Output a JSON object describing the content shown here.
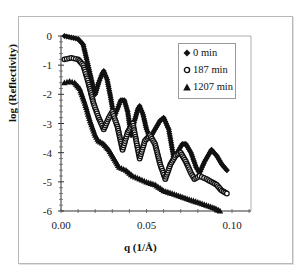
{
  "chart_data": {
    "type": "scatter",
    "title": "",
    "xlabel": "q (1/Å)",
    "ylabel": "log (Reflectivity)",
    "xlim": [
      0.0,
      0.12
    ],
    "ylim": [
      -6,
      0
    ],
    "x_ticks": [
      "0.00",
      "0.05",
      "0.10"
    ],
    "y_ticks": [
      "0",
      "-1",
      "-2",
      "-3",
      "-4",
      "-5",
      "-6"
    ],
    "grid": false,
    "legend_position": "upper right (inside)",
    "series": [
      {
        "name": "0 min",
        "marker": "diamond",
        "x": [
          0.002,
          0.006,
          0.01,
          0.013,
          0.015,
          0.017,
          0.019,
          0.02,
          0.022,
          0.024,
          0.025,
          0.027,
          0.029,
          0.031,
          0.033,
          0.035,
          0.037,
          0.039,
          0.041,
          0.043,
          0.045,
          0.046,
          0.048,
          0.05,
          0.052,
          0.055,
          0.058,
          0.06,
          0.063,
          0.066,
          0.069,
          0.071,
          0.073,
          0.076,
          0.079,
          0.081,
          0.084,
          0.087,
          0.088,
          0.091,
          0.094,
          0.097
        ],
        "y": [
          0.0,
          -0.05,
          -0.1,
          -0.3,
          -0.8,
          -1.3,
          -1.8,
          -2.0,
          -1.6,
          -1.3,
          -1.2,
          -1.5,
          -2.1,
          -2.8,
          -2.5,
          -2.2,
          -2.2,
          -2.6,
          -3.4,
          -2.9,
          -2.5,
          -2.4,
          -2.7,
          -3.2,
          -3.5,
          -3.2,
          -2.9,
          -2.8,
          -3.2,
          -4.2,
          -3.9,
          -3.7,
          -3.7,
          -4.0,
          -4.5,
          -4.7,
          -4.3,
          -4.0,
          -3.9,
          -4.1,
          -4.4,
          -4.6
        ]
      },
      {
        "name": "187 min",
        "marker": "open circle",
        "x": [
          0.002,
          0.006,
          0.01,
          0.013,
          0.016,
          0.019,
          0.022,
          0.025,
          0.028,
          0.03,
          0.033,
          0.036,
          0.039,
          0.042,
          0.046,
          0.049,
          0.052,
          0.055,
          0.058,
          0.061,
          0.064,
          0.067,
          0.07,
          0.073,
          0.076,
          0.078,
          0.081,
          0.085,
          0.088,
          0.091,
          0.094,
          0.097
        ],
        "y": [
          -0.8,
          -0.75,
          -0.8,
          -1.0,
          -1.6,
          -2.3,
          -2.8,
          -3.2,
          -2.8,
          -2.6,
          -3.1,
          -3.9,
          -3.3,
          -3.0,
          -4.2,
          -3.6,
          -3.4,
          -3.7,
          -4.4,
          -4.9,
          -4.4,
          -4.1,
          -4.0,
          -4.3,
          -4.7,
          -4.9,
          -4.8,
          -4.9,
          -5.0,
          -5.1,
          -5.3,
          -5.4
        ]
      },
      {
        "name": "1207 min",
        "marker": "filled triangle",
        "x": [
          0.002,
          0.005,
          0.008,
          0.011,
          0.014,
          0.017,
          0.02,
          0.022,
          0.025,
          0.028,
          0.031,
          0.034,
          0.038,
          0.042,
          0.046,
          0.05,
          0.055,
          0.06,
          0.065,
          0.07,
          0.075,
          0.08,
          0.085,
          0.09,
          0.093
        ],
        "y": [
          -1.6,
          -1.55,
          -1.6,
          -1.8,
          -2.3,
          -2.9,
          -3.4,
          -3.6,
          -3.7,
          -3.9,
          -4.2,
          -4.5,
          -4.6,
          -4.8,
          -4.9,
          -5.0,
          -5.1,
          -5.3,
          -5.4,
          -5.5,
          -5.6,
          -5.7,
          -5.8,
          -5.9,
          -6.0
        ]
      }
    ]
  },
  "axes": {
    "xlabel": "q (1/Å)",
    "ylabel": "log (Reflectivity)"
  },
  "legend": {
    "items": [
      {
        "label": "0 min",
        "marker": "diamond"
      },
      {
        "label": "187 min",
        "marker": "circle"
      },
      {
        "label": "1207 min",
        "marker": "triangle"
      }
    ]
  }
}
